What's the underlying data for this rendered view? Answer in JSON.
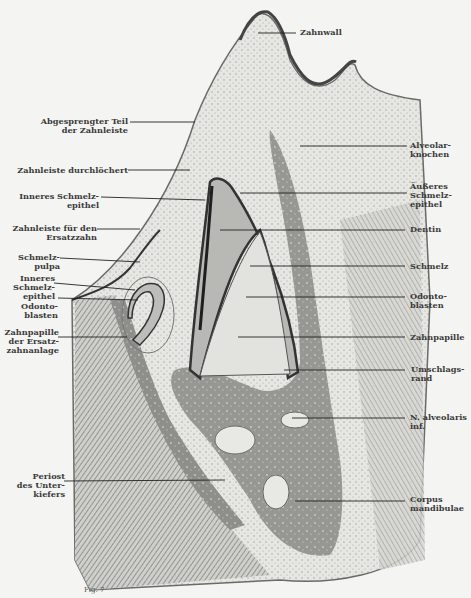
{
  "figure": {
    "type": "histological section illustration",
    "mark": "Fig. 7",
    "colors": {
      "background": "#f4f4f2",
      "bone": "#8a8a8a",
      "tissue": "#d8d8d4",
      "ink": "#3a3a3a",
      "dentin": "#b0b0ac"
    }
  },
  "labels_left": [
    {
      "id": "abgesprengter-teil",
      "lines": [
        "Abgesprengter Teil",
        "der Zahnleiste"
      ]
    },
    {
      "id": "zahnleiste-durchloechert",
      "lines": [
        "Zahnleiste durchlöchert"
      ]
    },
    {
      "id": "inneres-schmelzepithel-1",
      "lines": [
        "Inneres Schmelz-",
        "epithel"
      ]
    },
    {
      "id": "zahnleiste-ersatzzahn",
      "lines": [
        "Zahnleiste für den",
        "Ersatzzahn"
      ]
    },
    {
      "id": "schmelzpulpa",
      "lines": [
        "Schmelz-",
        "pulpa"
      ]
    },
    {
      "id": "inneres-schmelzepithel-2",
      "lines": [
        "Inneres",
        "Schmelz-",
        "epithel"
      ]
    },
    {
      "id": "odontoblasten-left",
      "lines": [
        "Odonto-",
        "blasten"
      ]
    },
    {
      "id": "zahnpapille-ersatz",
      "lines": [
        "Zahnpapille",
        "der Ersatz-",
        "zahnanlage"
      ]
    },
    {
      "id": "periost",
      "lines": [
        "Periost",
        "des Unter-",
        "kiefers"
      ]
    }
  ],
  "labels_right": [
    {
      "id": "zahnwall",
      "lines": [
        "Zahnwall"
      ]
    },
    {
      "id": "alveolarknochen",
      "lines": [
        "Alveolar-",
        "knochen"
      ]
    },
    {
      "id": "aeusseres-schmelzepithel",
      "lines": [
        "Äußeres",
        "Schmelz-",
        "epithel"
      ]
    },
    {
      "id": "dentin",
      "lines": [
        "Dentin"
      ]
    },
    {
      "id": "schmelz",
      "lines": [
        "Schmelz"
      ]
    },
    {
      "id": "odontoblasten-right",
      "lines": [
        "Odonto-",
        "blasten"
      ]
    },
    {
      "id": "zahnpapille",
      "lines": [
        "Zahnpapille"
      ]
    },
    {
      "id": "umschlagsrand",
      "lines": [
        "Umschlags-",
        "rand"
      ]
    },
    {
      "id": "n-alveolaris",
      "lines": [
        "N. alveolaris",
        "inf."
      ]
    },
    {
      "id": "corpus-mandibulae",
      "lines": [
        "Corpus",
        "mandibulae"
      ]
    }
  ]
}
